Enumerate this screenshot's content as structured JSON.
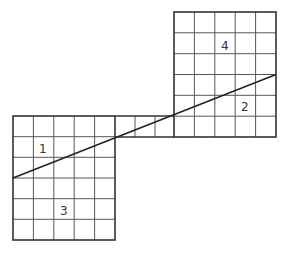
{
  "diagram": {
    "top_fragment_text": "",
    "cell_size_px": 20.4,
    "lower_left_grid": {
      "cols": 5,
      "rows": 6
    },
    "upper_right_grid": {
      "cols": 5,
      "rows": 6
    },
    "connector_strip": {
      "cols": 3,
      "rows": 1
    },
    "labels": {
      "region_1": "1",
      "region_2": "2",
      "region_3": "3",
      "region_4": "4"
    },
    "colors": {
      "line": "#222222",
      "grid": "#555555",
      "background": "#ffffff"
    }
  }
}
